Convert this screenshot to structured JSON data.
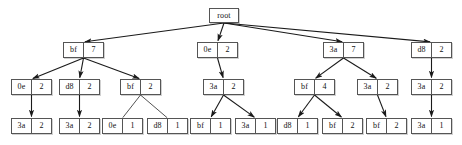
{
  "diagram": {
    "node_fill": "#ffffff",
    "node_stroke": "#555555",
    "edge_color": "#1a1a1a",
    "text_color": "#111111",
    "background": "#ffffff",
    "root": {
      "label": "root"
    },
    "nodes": [
      {
        "id": "n0",
        "key": "root",
        "value": "",
        "level": 0,
        "x": 209,
        "y": 8,
        "single": true
      },
      {
        "id": "n1",
        "key": "bf",
        "value": "7",
        "level": 1,
        "x": 63,
        "y": 42
      },
      {
        "id": "n2",
        "key": "0e",
        "value": "2",
        "level": 1,
        "x": 197,
        "y": 42
      },
      {
        "id": "n3",
        "key": "3a",
        "value": "7",
        "level": 1,
        "x": 323,
        "y": 42
      },
      {
        "id": "n4",
        "key": "d8",
        "value": "2",
        "level": 1,
        "x": 411,
        "y": 42
      },
      {
        "id": "n5",
        "key": "0e",
        "value": "2",
        "level": 2,
        "x": 11,
        "y": 79
      },
      {
        "id": "n6",
        "key": "d8",
        "value": "2",
        "level": 2,
        "x": 59,
        "y": 79
      },
      {
        "id": "n7",
        "key": "bf",
        "value": "2",
        "level": 2,
        "x": 120,
        "y": 79
      },
      {
        "id": "n8",
        "key": "3a",
        "value": "2",
        "level": 2,
        "x": 203,
        "y": 79
      },
      {
        "id": "n9",
        "key": "bf",
        "value": "4",
        "level": 2,
        "x": 294,
        "y": 79
      },
      {
        "id": "n10",
        "key": "3a",
        "value": "2",
        "level": 2,
        "x": 357,
        "y": 79
      },
      {
        "id": "n11",
        "key": "3a",
        "value": "2",
        "level": 2,
        "x": 411,
        "y": 79
      },
      {
        "id": "n12",
        "key": "3a",
        "value": "2",
        "level": 3,
        "x": 11,
        "y": 118
      },
      {
        "id": "n13",
        "key": "3a",
        "value": "2",
        "level": 3,
        "x": 59,
        "y": 118
      },
      {
        "id": "n14",
        "key": "0e",
        "value": "1",
        "level": 3,
        "x": 102,
        "y": 118
      },
      {
        "id": "n15",
        "key": "d8",
        "value": "1",
        "level": 3,
        "x": 147,
        "y": 118
      },
      {
        "id": "n16",
        "key": "bf",
        "value": "1",
        "level": 3,
        "x": 190,
        "y": 118
      },
      {
        "id": "n17",
        "key": "3a",
        "value": "1",
        "level": 3,
        "x": 235,
        "y": 118
      },
      {
        "id": "n18",
        "key": "d8",
        "value": "1",
        "level": 3,
        "x": 277,
        "y": 118
      },
      {
        "id": "n19",
        "key": "bf",
        "value": "2",
        "level": 3,
        "x": 322,
        "y": 118
      },
      {
        "id": "n20",
        "key": "bf",
        "value": "2",
        "level": 3,
        "x": 366,
        "y": 118
      },
      {
        "id": "n21",
        "key": "3a",
        "value": "1",
        "level": 3,
        "x": 411,
        "y": 118
      }
    ],
    "edges": [
      {
        "from": "n0",
        "to": "n1",
        "arrow": true
      },
      {
        "from": "n0",
        "to": "n2",
        "arrow": true
      },
      {
        "from": "n0",
        "to": "n3",
        "arrow": true
      },
      {
        "from": "n0",
        "to": "n4",
        "arrow": true
      },
      {
        "from": "n1",
        "to": "n5",
        "arrow": true
      },
      {
        "from": "n1",
        "to": "n6",
        "arrow": true
      },
      {
        "from": "n1",
        "to": "n7",
        "arrow": true
      },
      {
        "from": "n2",
        "to": "n8",
        "arrow": true
      },
      {
        "from": "n3",
        "to": "n9",
        "arrow": true
      },
      {
        "from": "n3",
        "to": "n10",
        "arrow": true
      },
      {
        "from": "n4",
        "to": "n11",
        "arrow": true
      },
      {
        "from": "n5",
        "to": "n12",
        "arrow": true
      },
      {
        "from": "n6",
        "to": "n13",
        "arrow": true
      },
      {
        "from": "n7",
        "to": "n14",
        "arrow": false
      },
      {
        "from": "n7",
        "to": "n15",
        "arrow": false
      },
      {
        "from": "n8",
        "to": "n16",
        "arrow": true
      },
      {
        "from": "n8",
        "to": "n17",
        "arrow": true
      },
      {
        "from": "n9",
        "to": "n18",
        "arrow": true
      },
      {
        "from": "n9",
        "to": "n19",
        "arrow": true
      },
      {
        "from": "n10",
        "to": "n20",
        "arrow": true
      },
      {
        "from": "n11",
        "to": "n21",
        "arrow": true
      }
    ]
  }
}
